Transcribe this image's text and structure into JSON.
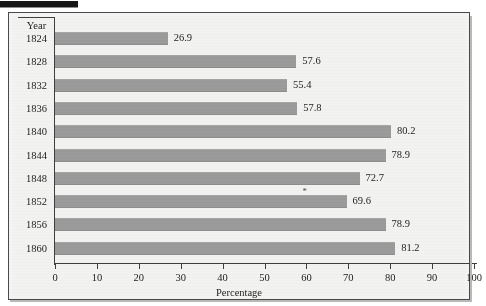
{
  "figure": {
    "scan_mark": "black-scan-bar"
  },
  "chart_data": {
    "type": "bar",
    "orientation": "horizontal",
    "title": "",
    "xlabel": "Percentage",
    "ylabel": "Year",
    "categories": [
      "1824",
      "1828",
      "1832",
      "1836",
      "1840",
      "1844",
      "1848",
      "1852",
      "1856",
      "1860"
    ],
    "values": [
      26.9,
      57.6,
      55.4,
      57.8,
      80.2,
      78.9,
      72.7,
      69.6,
      78.9,
      81.2
    ],
    "value_labels": [
      "26.9",
      "57.6",
      "55.4",
      "57.8",
      "80.2",
      "78.9",
      "72.7",
      "69.6",
      "78.9",
      "81.2"
    ],
    "xlim": [
      0,
      100
    ],
    "xticks": [
      0,
      10,
      20,
      30,
      40,
      50,
      60,
      70,
      80,
      90,
      100
    ],
    "xtick_labels": [
      "0",
      "10",
      "20",
      "30",
      "40",
      "50",
      "60",
      "70",
      "80",
      "90",
      "100"
    ],
    "grid": false,
    "legend": null,
    "annotations": [
      {
        "text": "*",
        "category": "1852",
        "note": "asterisk above 1852 bar"
      }
    ],
    "bar_color": "#9b9b9b",
    "background_color": "#f2f2f0",
    "axis_color": "#3e3e3e"
  },
  "axis": {
    "y_header": "Year",
    "x_title": "Percentage"
  }
}
